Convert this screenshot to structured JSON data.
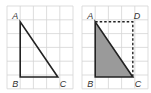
{
  "figures": [
    {
      "name": "left",
      "labels": {
        "A": "A",
        "B": "B",
        "C": "C"
      },
      "grid": {
        "cols": 5,
        "rows": 6
      },
      "triangle": {
        "A": [
          1,
          0
        ],
        "B": [
          1,
          4
        ],
        "C": [
          4,
          4
        ]
      },
      "shaded": false
    },
    {
      "name": "right",
      "labels": {
        "A": "A",
        "B": "B",
        "C": "C",
        "D": "D"
      },
      "grid": {
        "cols": 5,
        "rows": 6
      },
      "triangle": {
        "A": [
          1,
          0
        ],
        "B": [
          1,
          4
        ],
        "C": [
          4,
          4
        ]
      },
      "rectangle_dashed": {
        "D": [
          4,
          0
        ]
      },
      "shaded": true
    }
  ],
  "colors": {
    "grid": "#d4d4d4",
    "line": "#222222",
    "shade": "#9a9a9a"
  }
}
